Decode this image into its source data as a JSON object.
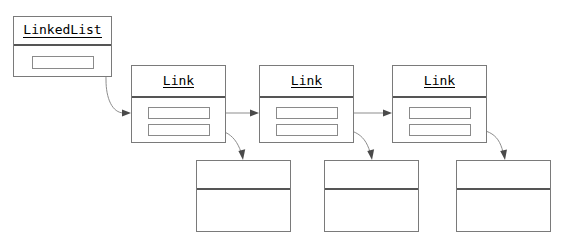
{
  "diagram": {
    "background_color": "#ffffff",
    "box_border_color": "#7a7a7a",
    "edge_color": "#8d8d8d",
    "arrowhead_color": "#4a4a4a"
  },
  "nodes": {
    "linkedlist": {
      "title": "LinkedList",
      "fields": [
        {
          "value": ""
        }
      ]
    },
    "link1": {
      "title": "Link",
      "fields": [
        {
          "value": ""
        },
        {
          "value": ""
        }
      ]
    },
    "link2": {
      "title": "Link",
      "fields": [
        {
          "value": ""
        },
        {
          "value": ""
        }
      ]
    },
    "link3": {
      "title": "Link",
      "fields": [
        {
          "value": ""
        },
        {
          "value": ""
        }
      ]
    },
    "data1": {
      "title": "",
      "body": ""
    },
    "data2": {
      "title": "",
      "body": ""
    },
    "data3": {
      "title": "",
      "body": ""
    }
  },
  "edges": [
    {
      "name": "linkedlist-to-link1",
      "from": "linkedlist.field1",
      "to": "link1",
      "style": "curved"
    },
    {
      "name": "link1-to-link2",
      "from": "link1.field1",
      "to": "link2",
      "style": "straight"
    },
    {
      "name": "link2-to-link3",
      "from": "link2.field1",
      "to": "link3",
      "style": "straight"
    },
    {
      "name": "link1-to-data1",
      "from": "link1.field2",
      "to": "data1",
      "style": "curved"
    },
    {
      "name": "link2-to-data2",
      "from": "link2.field2",
      "to": "data2",
      "style": "curved"
    },
    {
      "name": "link3-to-data3",
      "from": "link3.field2",
      "to": "data3",
      "style": "curved"
    }
  ]
}
